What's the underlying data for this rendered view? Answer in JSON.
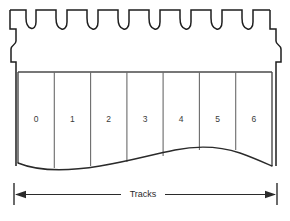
{
  "figure": {
    "background_color": "#ffffff",
    "line_color": "#1e1e1e",
    "text_color": "#2b2b2b"
  },
  "tape_edge": {
    "name": "sprocket-toothed top edge",
    "notch_count": 7,
    "notch_shape": "u-valley",
    "side_step_notches": 2
  },
  "tracks": {
    "count": 7,
    "labels": [
      "0",
      "1",
      "2",
      "3",
      "4",
      "5",
      "6"
    ],
    "divider_count": 6
  },
  "dimension": {
    "label": "Tracks",
    "arrow_left": "left-arrowhead",
    "arrow_right": "right-arrowhead"
  }
}
